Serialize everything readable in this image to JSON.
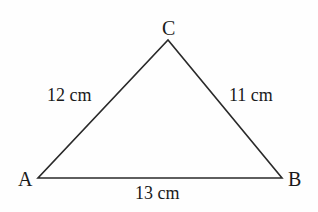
{
  "diagram": {
    "type": "triangle",
    "vertices": {
      "A": {
        "label": "A"
      },
      "B": {
        "label": "B"
      },
      "C": {
        "label": "C"
      }
    },
    "sides": {
      "AC": {
        "label": "12 cm"
      },
      "BC": {
        "label": "11 cm"
      },
      "AB": {
        "label": "13 cm"
      }
    },
    "colors": {
      "stroke": "#2a2a2a",
      "text": "#1a1a1a",
      "background": "#ffffff"
    }
  }
}
